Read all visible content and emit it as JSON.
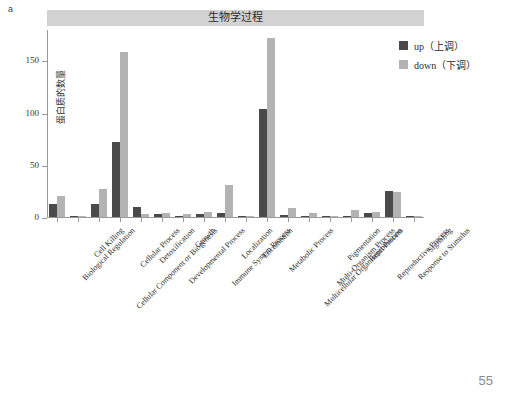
{
  "figure": {
    "panel_letter": "a",
    "title": "生物学过程",
    "page_number": "55"
  },
  "legend": {
    "position": "right",
    "items": [
      {
        "label": "up（上调）",
        "color": "#4a4a4a",
        "key": "up"
      },
      {
        "label": "down（下调）",
        "color": "#b3b3b3",
        "key": "down"
      }
    ]
  },
  "chart_data": {
    "type": "bar",
    "title": "生物学过程",
    "xlabel": "",
    "ylabel": "蛋白质的数量",
    "ylim": [
      0,
      180
    ],
    "yticks": [
      0,
      50,
      100,
      150
    ],
    "ytick_labels": [
      "0",
      "50",
      "100",
      "150"
    ],
    "grid": false,
    "legend_position": "right",
    "categories": [
      "Biological Regulation",
      "Cell Killing",
      "Cellular Component or Biogenesis",
      "Cellular Process",
      "Detoxification",
      "Developmental Process",
      "Growth",
      "Immune System Process",
      "Localization",
      "Locomotion",
      "Metabolic Process",
      "Multicellular Organismal Process",
      "Multi-Organism Process",
      "Pigmentation",
      "Reproduction",
      "Reproductive Process",
      "Response to Stimulus",
      "Signaling"
    ],
    "series": [
      {
        "name": "up（上调）",
        "color": "#4a4a4a",
        "values": [
          12,
          1,
          12,
          72,
          10,
          3,
          1,
          3,
          4,
          1,
          103,
          2,
          1,
          0,
          1,
          4,
          25,
          1
        ]
      },
      {
        "name": "down（下调）",
        "color": "#b3b3b3",
        "values": [
          20,
          1,
          27,
          158,
          3,
          4,
          3,
          5,
          31,
          1,
          171,
          9,
          4,
          1,
          7,
          5,
          24,
          1
        ]
      }
    ]
  }
}
